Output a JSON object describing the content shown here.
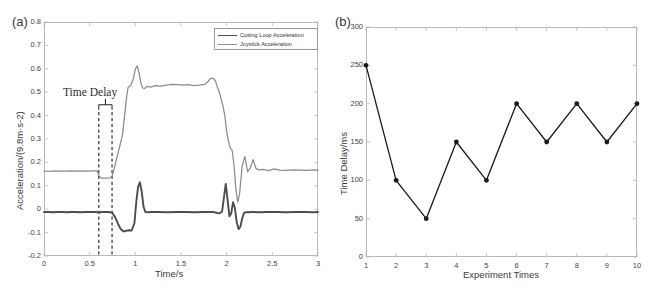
{
  "figure": {
    "panel_a_label": "(a)",
    "panel_b_label": "(b)",
    "line_color_cutting": "#4d4d4d",
    "line_color_joystick": "#8c8c8c",
    "axis_color": "#b9b9b9",
    "marker_color": "#1a1a1a"
  },
  "chart_data": [
    {
      "type": "line",
      "panel": "(a)",
      "title": "",
      "xlabel": "Time/s",
      "ylabel": "Acceleration/(9.8m·s-2)",
      "xlim": [
        0,
        3
      ],
      "ylim": [
        -0.2,
        0.8
      ],
      "xticks": [
        "0",
        "0.5",
        "1",
        "1.5",
        "2",
        "2.5",
        "3"
      ],
      "xtick_values": [
        0,
        0.5,
        1,
        1.5,
        2,
        2.5,
        3
      ],
      "yticks": [
        "0.8",
        "0.7",
        "0.6",
        "0.5",
        "0.4",
        "0.3",
        "0.2",
        "0.1",
        "0",
        "-0.1",
        "-0.2"
      ],
      "ytick_values": [
        0.8,
        0.7,
        0.6,
        0.5,
        0.4,
        0.3,
        0.2,
        0.1,
        0,
        -0.1,
        -0.2
      ],
      "grid": false,
      "legend_position": "top-right",
      "legend": [
        "Cutting Loop Acceleration",
        "Joystick Acceleration"
      ],
      "annotations": [
        {
          "text": "Time Delay",
          "x": 0.4,
          "y": 0.5
        },
        {
          "text": "dashed-marker-left",
          "x": 0.6
        },
        {
          "text": "dashed-marker-right",
          "x": 0.745
        }
      ],
      "series": [
        {
          "name": "Cutting Loop Acceleration",
          "color": "#4d4d4d",
          "x": [
            0.0,
            0.05,
            0.1,
            0.15,
            0.2,
            0.25,
            0.3,
            0.35,
            0.4,
            0.45,
            0.5,
            0.55,
            0.6,
            0.65,
            0.7,
            0.745,
            0.78,
            0.81,
            0.84,
            0.87,
            0.9,
            0.93,
            0.96,
            0.99,
            1.01,
            1.03,
            1.05,
            1.07,
            1.09,
            1.11,
            1.14,
            1.18,
            1.25,
            1.35,
            1.45,
            1.55,
            1.65,
            1.75,
            1.85,
            1.92,
            1.95,
            1.97,
            1.99,
            2.01,
            2.03,
            2.05,
            2.07,
            2.09,
            2.11,
            2.13,
            2.15,
            2.17,
            2.19,
            2.21,
            2.24,
            2.27,
            2.3,
            2.35,
            2.45,
            2.55,
            2.65,
            2.75,
            2.85,
            2.95,
            3.0
          ],
          "y": [
            -0.012,
            -0.012,
            -0.013,
            -0.012,
            -0.012,
            -0.013,
            -0.012,
            -0.012,
            -0.013,
            -0.012,
            -0.012,
            -0.012,
            -0.013,
            -0.012,
            -0.012,
            -0.014,
            -0.035,
            -0.062,
            -0.085,
            -0.095,
            -0.092,
            -0.09,
            -0.091,
            -0.06,
            0.03,
            0.095,
            0.115,
            0.075,
            0.01,
            -0.012,
            -0.013,
            -0.012,
            -0.012,
            -0.013,
            -0.012,
            -0.012,
            -0.013,
            -0.012,
            -0.012,
            -0.018,
            -0.01,
            0.05,
            0.108,
            0.04,
            -0.03,
            -0.018,
            0.03,
            0.005,
            -0.055,
            -0.085,
            -0.075,
            -0.04,
            -0.016,
            -0.013,
            -0.013,
            -0.012,
            -0.012,
            -0.013,
            -0.012,
            -0.012,
            -0.013,
            -0.012,
            -0.012,
            -0.013,
            -0.012
          ]
        },
        {
          "name": "Joystick Acceleration",
          "color": "#8c8c8c",
          "x": [
            0.0,
            0.06,
            0.12,
            0.18,
            0.24,
            0.3,
            0.36,
            0.42,
            0.48,
            0.54,
            0.58,
            0.61,
            0.64,
            0.68,
            0.72,
            0.745,
            0.77,
            0.8,
            0.83,
            0.86,
            0.88,
            0.9,
            0.92,
            0.95,
            0.98,
            1.0,
            1.02,
            1.04,
            1.06,
            1.08,
            1.1,
            1.13,
            1.17,
            1.22,
            1.28,
            1.34,
            1.4,
            1.46,
            1.52,
            1.58,
            1.64,
            1.7,
            1.76,
            1.8,
            1.83,
            1.86,
            1.88,
            1.9,
            1.92,
            1.94,
            1.96,
            1.98,
            2.0,
            2.02,
            2.04,
            2.06,
            2.08,
            2.1,
            2.12,
            2.14,
            2.17,
            2.2,
            2.23,
            2.26,
            2.29,
            2.32,
            2.35,
            2.4,
            2.46,
            2.52,
            2.58,
            2.65,
            2.72,
            2.8,
            2.88,
            2.95,
            3.0
          ],
          "y": [
            0.163,
            0.162,
            0.164,
            0.163,
            0.163,
            0.164,
            0.163,
            0.164,
            0.163,
            0.164,
            0.164,
            0.138,
            0.132,
            0.133,
            0.134,
            0.14,
            0.175,
            0.225,
            0.27,
            0.32,
            0.39,
            0.465,
            0.52,
            0.53,
            0.56,
            0.6,
            0.612,
            0.585,
            0.54,
            0.518,
            0.516,
            0.525,
            0.522,
            0.528,
            0.526,
            0.53,
            0.533,
            0.532,
            0.53,
            0.532,
            0.528,
            0.53,
            0.533,
            0.548,
            0.56,
            0.558,
            0.545,
            0.52,
            0.5,
            0.47,
            0.44,
            0.4,
            0.33,
            0.29,
            0.26,
            0.252,
            0.19,
            0.09,
            0.03,
            0.06,
            0.185,
            0.225,
            0.16,
            0.178,
            0.212,
            0.175,
            0.168,
            0.17,
            0.165,
            0.172,
            0.167,
            0.166,
            0.168,
            0.167,
            0.166,
            0.168,
            0.167
          ]
        }
      ]
    },
    {
      "type": "line",
      "panel": "(b)",
      "title": "",
      "xlabel": "Experiment Times",
      "ylabel": "Time Delay/ms",
      "xlim": [
        1,
        10
      ],
      "ylim": [
        0,
        300
      ],
      "xticks": [
        "1",
        "2",
        "3",
        "4",
        "5",
        "6",
        "7",
        "8",
        "9",
        "10"
      ],
      "xtick_values": [
        1,
        2,
        3,
        4,
        5,
        6,
        7,
        8,
        9,
        10
      ],
      "yticks": [
        "300",
        "250",
        "200",
        "150",
        "100",
        "50",
        "0"
      ],
      "ytick_values": [
        300,
        250,
        200,
        150,
        100,
        50,
        0
      ],
      "grid": false,
      "marker": "filled-circle",
      "categories": [
        1,
        2,
        3,
        4,
        5,
        6,
        7,
        8,
        9,
        10
      ],
      "values": [
        250,
        100,
        50,
        150,
        100,
        200,
        150,
        200,
        150,
        200
      ]
    }
  ]
}
